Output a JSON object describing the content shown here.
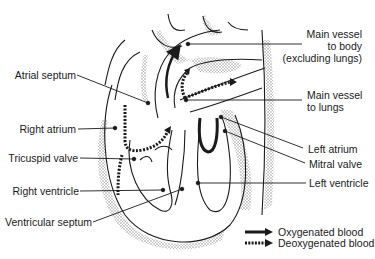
{
  "figure": {
    "type": "anatomical-diagram",
    "colors": {
      "line": "#1a1a1a",
      "shading": "#b8b8b8",
      "background": "#ffffff"
    }
  },
  "labels": {
    "atrial_septum": "Atrial septum",
    "right_atrium": "Right atrium",
    "tricuspid_valve": "Tricuspid valve",
    "right_ventricle": "Right ventricle",
    "ventricular_septum": "Ventricular septum",
    "main_vessel_body_1": "Main vessel",
    "main_vessel_body_2": "to body",
    "main_vessel_body_3": "(excluding lungs)",
    "main_vessel_lungs_1": "Main vessel",
    "main_vessel_lungs_2": "to lungs",
    "left_atrium": "Left atrium",
    "mitral_valve": "Mitral valve",
    "left_ventricle": "Left ventricle"
  },
  "legend": {
    "items": [
      {
        "label": "Oxygenated blood",
        "style": "solid-arrow"
      },
      {
        "label": "Deoxygenated blood",
        "style": "dotted-arrow"
      }
    ]
  }
}
